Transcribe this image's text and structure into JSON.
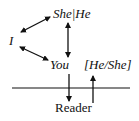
{
  "diagram": {
    "nodes": {
      "narrator": "I",
      "third_person": "She|He",
      "addressee": "You",
      "bracketed_third": "[He/She]",
      "reader": "Reader"
    },
    "edges": [
      {
        "from": "I",
        "to": "She|He",
        "type": "bidirectional"
      },
      {
        "from": "I",
        "to": "You",
        "type": "bidirectional"
      },
      {
        "from": "She|He",
        "to": "You",
        "type": "bidirectional"
      },
      {
        "from": "You",
        "to": "Reader",
        "type": "directed",
        "crosses_line": true
      },
      {
        "from": "Reader",
        "to": "[He/She]",
        "type": "directed",
        "crosses_line": true
      }
    ],
    "colors": {
      "ink": "#111111",
      "background": "#ffffff"
    }
  }
}
